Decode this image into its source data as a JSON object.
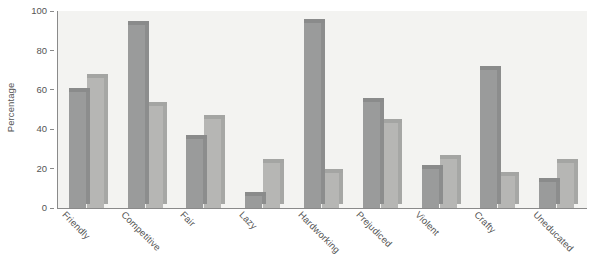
{
  "chart_data": {
    "type": "bar",
    "title": "",
    "subtitle": "",
    "xlabel": "",
    "ylabel": "Percentage",
    "ylim": [
      0,
      100
    ],
    "yticks": [
      0,
      20,
      40,
      60,
      80,
      100
    ],
    "grid": false,
    "legend": "none",
    "orientation": "vertical",
    "grouping": "grouped",
    "categories": [
      "Friendly",
      "Competitive",
      "Fair",
      "Lazy",
      "Hardworking",
      "Prejudiced",
      "Violent",
      "Crafty",
      "Uneducated"
    ],
    "series": [
      {
        "name": "series-1",
        "color": "#9a9b9b",
        "values": [
          59,
          93,
          35,
          6,
          94,
          54,
          20,
          70,
          13
        ]
      },
      {
        "name": "series-2",
        "color": "#b6b6b4",
        "values": [
          66,
          52,
          45,
          23,
          18,
          43,
          25,
          16,
          23
        ]
      }
    ]
  },
  "axes": {
    "y_title": "Percentage",
    "y_tick_labels": [
      "0",
      "20",
      "40",
      "60",
      "80",
      "100"
    ],
    "x_tick_labels": [
      "Friendly",
      "Competitive",
      "Fair",
      "Lazy",
      "Hardworking",
      "Prejudiced",
      "Violent",
      "Crafty",
      "Uneducated"
    ]
  },
  "style": {
    "plot_background": "#f3f3f1",
    "page_background": "#ffffff",
    "axis_color": "#8a8a8a",
    "text_color": "#555555",
    "series_1_color": "#9a9b9b",
    "series_2_color": "#b6b6b4"
  }
}
